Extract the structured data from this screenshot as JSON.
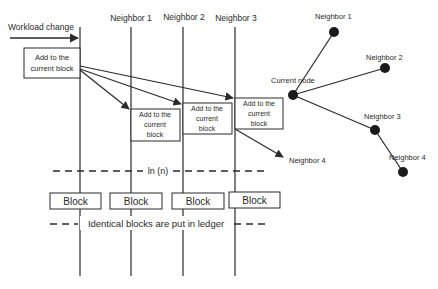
{
  "diagram": {
    "left": {
      "workload_label": "Workload change",
      "columns": [
        "Neighbor 1",
        "Neighbor 2",
        "Neighbor 3"
      ],
      "boxes": [
        {
          "lines": [
            "Add to the",
            "current block"
          ]
        },
        {
          "lines": [
            "Add to the",
            "current",
            "block"
          ]
        },
        {
          "lines": [
            "Add to the",
            "current",
            "block"
          ]
        },
        {
          "lines": [
            "Add to the",
            "current",
            "block"
          ]
        }
      ],
      "neighbor4_label": "Neighbor 4",
      "ln_label": "ln (n)",
      "blocks": [
        "Block",
        "Block",
        "Block",
        "Block"
      ],
      "ledger_label": "Identical blocks are put in ledger"
    },
    "right": {
      "current_node": "Current node",
      "neighbors": [
        "Neighbor 1",
        "Neighbor 2",
        "Neighbor 3",
        "Neighbor 4"
      ]
    },
    "colors": {
      "line": "#2a2a2a",
      "node": "#1a1a1a",
      "background": "#ffffff"
    }
  }
}
